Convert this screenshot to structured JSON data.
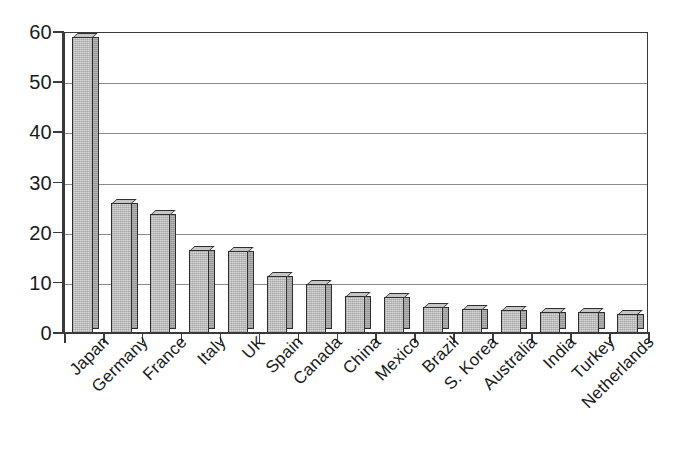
{
  "chart_data": {
    "type": "bar",
    "title": "",
    "subtitle": "",
    "xlabel": "",
    "ylabel": "",
    "ylim": [
      0,
      60
    ],
    "ytick_values": [
      0,
      10,
      20,
      30,
      40,
      50,
      60
    ],
    "ytick_labels": [
      "0",
      "10",
      "20",
      "30",
      "40",
      "50",
      "60"
    ],
    "grid": true,
    "grid_axis": "y",
    "legend": false,
    "legend_position": "none",
    "bar_style": "3d-shaded-gray",
    "categories": [
      "Japan",
      "Germany",
      "France",
      "Italy",
      "UK",
      "Spain",
      "Canada",
      "China",
      "Mexico",
      "Brazil",
      "S. Korea",
      "Australia",
      "India",
      "Turkey",
      "Netherlands"
    ],
    "values": [
      59.0,
      26.0,
      23.8,
      16.5,
      16.3,
      11.4,
      9.7,
      7.4,
      7.2,
      5.2,
      4.8,
      4.5,
      4.2,
      4.1,
      3.8
    ]
  },
  "colors": {
    "bar_fill": "#d9d9d9",
    "bar_side": "#b4b4b4",
    "bar_top": "#c6c6c6",
    "bar_outline": "#2e2e2e",
    "gridline": "#8c8c8c",
    "axis": "#3a3a3a",
    "text": "#1b1b1b",
    "background": "#ffffff"
  }
}
